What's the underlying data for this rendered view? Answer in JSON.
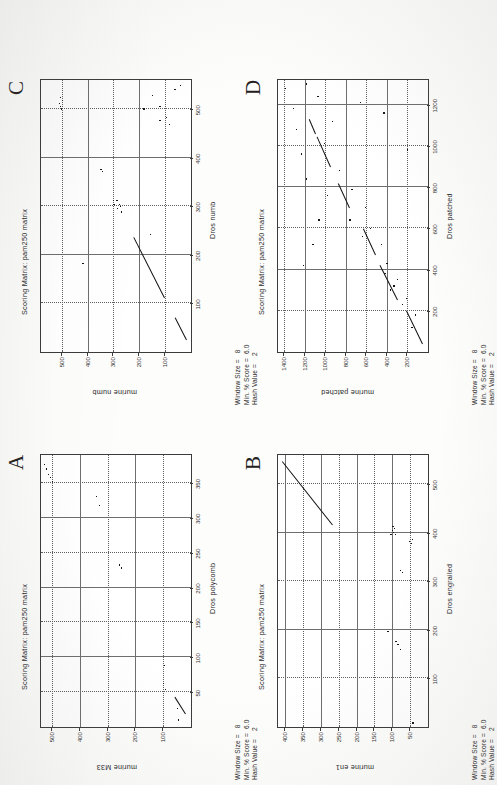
{
  "document": {
    "kind": "scanned-figure-page",
    "orientation": "rotated-90-ccw",
    "background": "#fdfdfb",
    "ink": "#151515"
  },
  "panels": [
    {
      "letter": "A",
      "matrix_title": "Scoring Matrix:  pam250  matrix",
      "params": "Window Size =   8\nMin. % Score =  6.0\nHash Value =    2",
      "params_lines": [
        "Window Size =   8",
        "Min. % Score =  6.0",
        "Hash Value =    2"
      ],
      "xlabel": "Dros polycomb",
      "ylabel": "murine M33",
      "xticks": [
        50,
        100,
        150,
        200,
        250,
        300,
        350
      ],
      "yticks": [
        100,
        200,
        300,
        400,
        500
      ],
      "xlim": [
        0,
        390
      ],
      "ylim": [
        0,
        540
      ]
    },
    {
      "letter": "B",
      "matrix_title": "Scoring Matrix:  pam250  matrix",
      "params": "Window Size =   8\nMin. % Score =  6.0\nHash Value =    2",
      "params_lines": [
        "Window Size =   8",
        "Min. % Score =  6.0",
        "Hash Value =    2"
      ],
      "xlabel": "Dros engrailed",
      "ylabel": "murine en1",
      "xticks": [
        100,
        200,
        300,
        400,
        500
      ],
      "yticks": [
        50,
        100,
        150,
        200,
        250,
        300,
        350,
        400
      ],
      "xlim": [
        0,
        560
      ],
      "ylim": [
        0,
        420
      ]
    },
    {
      "letter": "C",
      "matrix_title": "Scoring Matrix:  pam250  matrix",
      "params": "Window Size =   8\nMin. % Score =  6.0\nHash Value =    2",
      "params_lines": [
        "Window Size =   8",
        "Min. % Score =  6.0",
        "Hash Value =    2"
      ],
      "xlabel": "Dros numb",
      "ylabel": "murine numb",
      "xticks": [
        100,
        200,
        300,
        400,
        500
      ],
      "yticks": [
        100,
        200,
        300,
        400,
        500
      ],
      "xlim": [
        0,
        560
      ],
      "ylim": [
        0,
        580
      ]
    },
    {
      "letter": "D",
      "matrix_title": "Scoring Matrix:  pam250  matrix",
      "params": "Window Size =   8\nMin. % Score =  6.0\nHash Value =    2",
      "params_lines": [
        "Window Size =   8",
        "Min. % Score =  6.0",
        "Hash Value =    2"
      ],
      "xlabel": "Dros patched",
      "ylabel": "murine patched",
      "xticks": [
        200,
        400,
        600,
        800,
        1000,
        1200
      ],
      "yticks": [
        200,
        400,
        600,
        800,
        1000,
        1200,
        1400
      ],
      "xlim": [
        0,
        1320
      ],
      "ylim": [
        0,
        1460
      ]
    }
  ],
  "chart_data": [
    {
      "id": "A",
      "type": "scatter",
      "title": "Scoring Matrix:  pam250  matrix",
      "xlabel": "Dros polycomb",
      "ylabel": "murine M33",
      "xlim": [
        0,
        390
      ],
      "ylim": [
        0,
        540
      ],
      "xticks": [
        50,
        100,
        150,
        200,
        250,
        300,
        350
      ],
      "yticks": [
        100,
        200,
        300,
        400,
        500
      ],
      "grid": true,
      "legend": "none",
      "annotations": [
        "Window Size =   8",
        "Min. % Score =  6.0",
        "Hash Value =    2"
      ],
      "diagonals": [
        {
          "x0": 18,
          "y0": 22,
          "x1": 42,
          "y1": 60
        }
      ],
      "points": [
        [
          10,
          45
        ],
        [
          26,
          50
        ],
        [
          54,
          92
        ],
        [
          62,
          98
        ],
        [
          88,
          96
        ],
        [
          228,
          250
        ],
        [
          232,
          258
        ],
        [
          318,
          330
        ],
        [
          330,
          340
        ],
        [
          352,
          498
        ],
        [
          358,
          506
        ],
        [
          362,
          512
        ],
        [
          370,
          520
        ],
        [
          376,
          528
        ]
      ]
    },
    {
      "id": "B",
      "type": "scatter",
      "title": "Scoring Matrix:  pam250  matrix",
      "xlabel": "Dros engrailed",
      "ylabel": "murine en1",
      "xlim": [
        0,
        560
      ],
      "ylim": [
        0,
        420
      ],
      "xticks": [
        100,
        200,
        300,
        400,
        500
      ],
      "yticks": [
        50,
        100,
        150,
        200,
        250,
        300,
        350,
        400
      ],
      "grid": true,
      "legend": "none",
      "annotations": [
        "Window Size =   8",
        "Min. % Score =  6.0",
        "Hash Value =    2"
      ],
      "diagonals": [
        {
          "x0": 415,
          "y0": 268,
          "x1": 545,
          "y1": 408
        }
      ],
      "points": [
        [
          8,
          42
        ],
        [
          160,
          78
        ],
        [
          170,
          84
        ],
        [
          176,
          90
        ],
        [
          196,
          112
        ],
        [
          318,
          72
        ],
        [
          322,
          78
        ],
        [
          378,
          46
        ],
        [
          382,
          52
        ],
        [
          386,
          44
        ],
        [
          396,
          92
        ],
        [
          400,
          96
        ],
        [
          404,
          100
        ],
        [
          408,
          94
        ],
        [
          412,
          98
        ],
        [
          396,
          104
        ]
      ]
    },
    {
      "id": "C",
      "type": "scatter",
      "title": "Scoring Matrix:  pam250  matrix",
      "xlabel": "Dros numb",
      "ylabel": "murine numb",
      "xlim": [
        0,
        560
      ],
      "ylim": [
        0,
        580
      ],
      "xticks": [
        100,
        200,
        300,
        400,
        500
      ],
      "yticks": [
        100,
        200,
        300,
        400,
        500
      ],
      "grid": true,
      "legend": "none",
      "annotations": [
        "Window Size =   8",
        "Min. % Score =  6.0",
        "Hash Value =    2"
      ],
      "diagonals": [
        {
          "x0": 24,
          "y0": 18,
          "x1": 70,
          "y1": 62
        },
        {
          "x0": 112,
          "y0": 104,
          "x1": 236,
          "y1": 222
        }
      ],
      "points": [
        [
          182,
          418
        ],
        [
          242,
          158
        ],
        [
          288,
          270
        ],
        [
          296,
          284
        ],
        [
          300,
          272
        ],
        [
          304,
          278
        ],
        [
          312,
          286
        ],
        [
          304,
          298
        ],
        [
          312,
          300
        ],
        [
          372,
          342
        ],
        [
          376,
          348
        ],
        [
          468,
          82
        ],
        [
          476,
          120
        ],
        [
          482,
          94
        ],
        [
          500,
          500
        ],
        [
          506,
          506
        ],
        [
          512,
          510
        ],
        [
          518,
          498
        ],
        [
          524,
          504
        ],
        [
          500,
          182
        ],
        [
          506,
          120
        ],
        [
          540,
          62
        ],
        [
          548,
          42
        ],
        [
          528,
          148
        ]
      ]
    },
    {
      "id": "D",
      "type": "scatter",
      "title": "Scoring Matrix:  pam250  matrix",
      "xlabel": "Dros patched",
      "ylabel": "murine patched",
      "xlim": [
        0,
        1320
      ],
      "ylim": [
        0,
        1460
      ],
      "xticks": [
        200,
        400,
        600,
        800,
        1000,
        1200
      ],
      "yticks": [
        200,
        400,
        600,
        800,
        1000,
        1200,
        1400
      ],
      "grid": true,
      "legend": "none",
      "annotations": [
        "Window Size =   8",
        "Min. % Score =  6.0",
        "Hash Value =    2"
      ],
      "diagonals": [
        {
          "x0": 40,
          "y0": 60,
          "x1": 200,
          "y1": 215
        },
        {
          "x0": 252,
          "y0": 300,
          "x1": 420,
          "y1": 470
        },
        {
          "x0": 470,
          "y0": 520,
          "x1": 600,
          "y1": 640
        },
        {
          "x0": 700,
          "y0": 770,
          "x1": 820,
          "y1": 880
        },
        {
          "x0": 900,
          "y0": 955,
          "x1": 1045,
          "y1": 1085
        },
        {
          "x0": 1060,
          "y0": 1100,
          "x1": 1130,
          "y1": 1160
        }
      ],
      "points": [
        [
          120,
          155
        ],
        [
          180,
          120
        ],
        [
          230,
          250
        ],
        [
          260,
          210
        ],
        [
          300,
          365
        ],
        [
          320,
          330
        ],
        [
          350,
          300
        ],
        [
          380,
          420
        ],
        [
          430,
          400
        ],
        [
          520,
          455
        ],
        [
          560,
          640
        ],
        [
          600,
          560
        ],
        [
          640,
          760
        ],
        [
          700,
          610
        ],
        [
          760,
          980
        ],
        [
          790,
          740
        ],
        [
          840,
          1180
        ],
        [
          880,
          860
        ],
        [
          960,
          1230
        ],
        [
          1010,
          1010
        ],
        [
          1080,
          1280
        ],
        [
          1120,
          930
        ],
        [
          1180,
          1310
        ],
        [
          1240,
          1070
        ],
        [
          1280,
          1390
        ],
        [
          1300,
          1180
        ],
        [
          420,
          1215
        ],
        [
          520,
          1120
        ],
        [
          640,
          1060
        ],
        [
          980,
          200
        ],
        [
          1160,
          430
        ],
        [
          1210,
          660
        ]
      ]
    }
  ]
}
